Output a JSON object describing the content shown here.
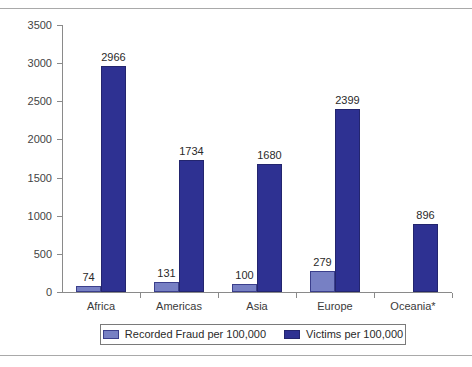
{
  "figure": {
    "clipped_caption_above": "",
    "background_color": "#ffffff"
  },
  "chart_data": {
    "type": "bar",
    "title": "",
    "subtitle": "",
    "xlabel": "",
    "ylabel": "",
    "categories": [
      "Africa",
      "Americas",
      "Asia",
      "Europe",
      "Oceania*"
    ],
    "series": [
      {
        "name": "Recorded Fraud per 100,000",
        "color": "#7780c4",
        "values": [
          74,
          131,
          100,
          279,
          null
        ]
      },
      {
        "name": "Victims per 100,000",
        "color": "#2e3192",
        "values": [
          2966,
          1734,
          1680,
          2399,
          896
        ]
      }
    ],
    "ylim": [
      0,
      3500
    ],
    "ytick_values": [
      0,
      500,
      1000,
      1500,
      2000,
      2500,
      3000,
      3500
    ],
    "ytick_labels": [
      "0",
      "500",
      "1000",
      "1500",
      "2000",
      "2500",
      "3000",
      "3500"
    ],
    "grid": false,
    "legend_position": "bottom",
    "data_labels_shown": true
  },
  "axis": {
    "y_label_color": "#444444",
    "x_label_color": "#3a3a3a",
    "line_color": "#8a8a8a"
  },
  "legend": {
    "entries": [
      {
        "label": "Recorded Fraud per 100,000",
        "swatch": "light"
      },
      {
        "label": "Victims per 100,000",
        "swatch": "dark"
      }
    ]
  }
}
